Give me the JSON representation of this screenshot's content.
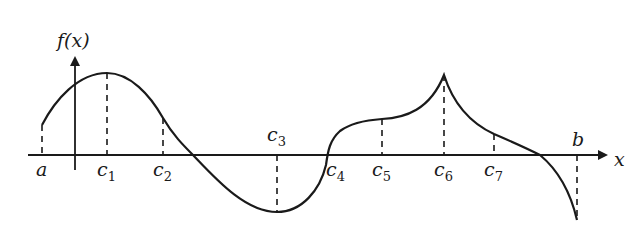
{
  "figure": {
    "y_axis_label": "f(x)",
    "x_axis_label": "x",
    "colors": {
      "ink": "#1a1a1a",
      "background": "#ffffff"
    }
  },
  "points": [
    {
      "id": "a",
      "name": "a",
      "sub": "",
      "x": 42,
      "y_curve": 125,
      "label_pos": "below"
    },
    {
      "id": "c1",
      "name": "c",
      "sub": "1",
      "x": 107,
      "y_curve": 73,
      "label_pos": "below"
    },
    {
      "id": "c2",
      "name": "c",
      "sub": "2",
      "x": 163,
      "y_curve": 118,
      "label_pos": "below"
    },
    {
      "id": "c3",
      "name": "c",
      "sub": "3",
      "x": 277,
      "y_curve": 212,
      "label_pos": "above"
    },
    {
      "id": "c4",
      "name": "c",
      "sub": "4",
      "x": 328,
      "y_curve": 155,
      "label_pos": "below"
    },
    {
      "id": "c5",
      "name": "c",
      "sub": "5",
      "x": 382,
      "y_curve": 119,
      "label_pos": "below"
    },
    {
      "id": "c6",
      "name": "c",
      "sub": "6",
      "x": 444,
      "y_curve": 75,
      "label_pos": "below"
    },
    {
      "id": "c7",
      "name": "c",
      "sub": "7",
      "x": 494,
      "y_curve": 134,
      "label_pos": "below"
    },
    {
      "id": "b",
      "name": "b",
      "sub": "",
      "x": 577,
      "y_curve": 220,
      "label_pos": "above"
    }
  ]
}
